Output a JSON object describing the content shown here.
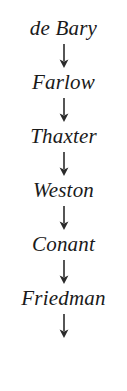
{
  "diagram": {
    "type": "vertical-lineage-chain",
    "orientation": "top-to-bottom",
    "connector": "downward-arrow",
    "nodes": [
      {
        "label": "de Bary"
      },
      {
        "label": "Farlow"
      },
      {
        "label": "Thaxter"
      },
      {
        "label": "Weston"
      },
      {
        "label": "Conant"
      },
      {
        "label": "Friedman"
      }
    ],
    "trailing_connector": true,
    "colors": {
      "text": "#1a1a1a",
      "arrow": "#2b2b2b",
      "background": "#ffffff"
    }
  }
}
